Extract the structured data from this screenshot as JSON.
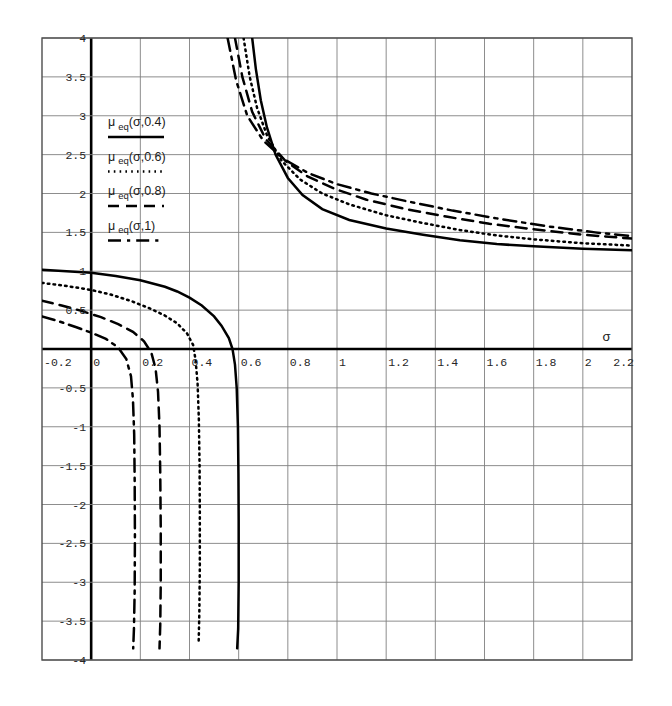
{
  "chart_data": {
    "type": "line",
    "title": "",
    "xlabel": "σ",
    "ylabel": "",
    "xlim": [
      -0.2,
      2.2
    ],
    "ylim": [
      -4,
      4
    ],
    "grid": true,
    "legend_position": "upper-left-inside",
    "x_ticks": [
      "-0.2",
      "0",
      "0.2",
      "0.4",
      "0.6",
      "0.8",
      "1",
      "1.2",
      "1.4",
      "1.6",
      "1.8",
      "2",
      "2.2"
    ],
    "x_tick_values": [
      -0.2,
      0,
      0.2,
      0.4,
      0.6,
      0.8,
      1,
      1.2,
      1.4,
      1.6,
      1.8,
      2,
      2.2
    ],
    "y_ticks": [
      "4",
      "3.5",
      "3",
      "2.5",
      "2",
      "1.5",
      "1",
      "0.5",
      "-0.5",
      "-1",
      "-1.5",
      "-2",
      "-2.5",
      "-3",
      "-3.5",
      "-4"
    ],
    "y_tick_values": [
      4,
      3.5,
      3,
      2.5,
      2,
      1.5,
      1,
      0.5,
      -0.5,
      -1,
      -1.5,
      -2,
      -2.5,
      -3,
      -3.5,
      -4
    ],
    "series": [
      {
        "name": "μ eq(σ,0.4)",
        "style": "solid",
        "color": "#000000",
        "asymptote": 0.6,
        "left_branch": [
          [
            -0.2,
            1.02
          ],
          [
            -0.1,
            1.0
          ],
          [
            0.0,
            0.98
          ],
          [
            0.1,
            0.94
          ],
          [
            0.2,
            0.885
          ],
          [
            0.3,
            0.8
          ],
          [
            0.35,
            0.74
          ],
          [
            0.4,
            0.66
          ],
          [
            0.45,
            0.56
          ],
          [
            0.5,
            0.42
          ],
          [
            0.53,
            0.3
          ],
          [
            0.56,
            0.14
          ],
          [
            0.575,
            0.0
          ],
          [
            0.585,
            -0.2
          ],
          [
            0.592,
            -0.5
          ],
          [
            0.597,
            -1.0
          ],
          [
            0.599,
            -1.6
          ],
          [
            0.6,
            -2.2
          ],
          [
            0.6,
            -3.0
          ],
          [
            0.598,
            -3.6
          ],
          [
            0.594,
            -3.85
          ]
        ],
        "right_branch": [
          [
            0.655,
            4.0
          ],
          [
            0.67,
            3.6
          ],
          [
            0.69,
            3.2
          ],
          [
            0.715,
            2.85
          ],
          [
            0.75,
            2.5
          ],
          [
            0.8,
            2.2
          ],
          [
            0.86,
            1.98
          ],
          [
            0.94,
            1.8
          ],
          [
            1.05,
            1.66
          ],
          [
            1.2,
            1.55
          ],
          [
            1.35,
            1.47
          ],
          [
            1.5,
            1.4
          ],
          [
            1.65,
            1.35
          ],
          [
            1.8,
            1.32
          ],
          [
            2.0,
            1.29
          ],
          [
            2.2,
            1.27
          ]
        ]
      },
      {
        "name": "μ eq(σ,0.6)",
        "style": "dotted",
        "color": "#000000",
        "asymptote": 0.44,
        "left_branch": [
          [
            -0.2,
            0.85
          ],
          [
            -0.1,
            0.81
          ],
          [
            0.0,
            0.76
          ],
          [
            0.08,
            0.7
          ],
          [
            0.16,
            0.62
          ],
          [
            0.24,
            0.52
          ],
          [
            0.3,
            0.43
          ],
          [
            0.35,
            0.33
          ],
          [
            0.39,
            0.2
          ],
          [
            0.415,
            0.05
          ],
          [
            0.425,
            -0.15
          ],
          [
            0.433,
            -0.45
          ],
          [
            0.438,
            -0.9
          ],
          [
            0.441,
            -1.5
          ],
          [
            0.442,
            -2.1
          ],
          [
            0.442,
            -2.8
          ],
          [
            0.44,
            -3.4
          ],
          [
            0.437,
            -3.8
          ]
        ],
        "right_branch": [
          [
            0.62,
            4.0
          ],
          [
            0.645,
            3.5
          ],
          [
            0.675,
            3.1
          ],
          [
            0.715,
            2.75
          ],
          [
            0.775,
            2.42
          ],
          [
            0.85,
            2.18
          ],
          [
            0.94,
            2.0
          ],
          [
            1.05,
            1.86
          ],
          [
            1.2,
            1.72
          ],
          [
            1.35,
            1.62
          ],
          [
            1.5,
            1.53
          ],
          [
            1.65,
            1.46
          ],
          [
            1.8,
            1.41
          ],
          [
            2.0,
            1.36
          ],
          [
            2.2,
            1.33
          ]
        ]
      },
      {
        "name": "μ eq(σ,0.8)",
        "style": "dashed",
        "color": "#000000",
        "asymptote": 0.28,
        "left_branch": [
          [
            -0.2,
            0.62
          ],
          [
            -0.12,
            0.56
          ],
          [
            -0.04,
            0.49
          ],
          [
            0.04,
            0.41
          ],
          [
            0.11,
            0.32
          ],
          [
            0.17,
            0.22
          ],
          [
            0.215,
            0.1
          ],
          [
            0.245,
            -0.05
          ],
          [
            0.262,
            -0.25
          ],
          [
            0.272,
            -0.55
          ],
          [
            0.278,
            -1.0
          ],
          [
            0.281,
            -1.6
          ],
          [
            0.283,
            -2.3
          ],
          [
            0.283,
            -3.0
          ],
          [
            0.281,
            -3.55
          ],
          [
            0.278,
            -3.85
          ]
        ],
        "right_branch": [
          [
            0.585,
            4.0
          ],
          [
            0.615,
            3.5
          ],
          [
            0.655,
            3.05
          ],
          [
            0.71,
            2.7
          ],
          [
            0.79,
            2.42
          ],
          [
            0.88,
            2.22
          ],
          [
            0.99,
            2.06
          ],
          [
            1.12,
            1.92
          ],
          [
            1.28,
            1.8
          ],
          [
            1.45,
            1.7
          ],
          [
            1.62,
            1.61
          ],
          [
            1.8,
            1.54
          ],
          [
            2.0,
            1.47
          ],
          [
            2.2,
            1.42
          ]
        ]
      },
      {
        "name": "μ eq(σ,1)",
        "style": "dashdot",
        "color": "#000000",
        "asymptote": 0.175,
        "left_branch": [
          [
            -0.2,
            0.42
          ],
          [
            -0.13,
            0.355
          ],
          [
            -0.06,
            0.28
          ],
          [
            0.0,
            0.21
          ],
          [
            0.06,
            0.13
          ],
          [
            0.11,
            0.02
          ],
          [
            0.143,
            -0.13
          ],
          [
            0.162,
            -0.35
          ],
          [
            0.17,
            -0.65
          ],
          [
            0.175,
            -1.1
          ],
          [
            0.177,
            -1.7
          ],
          [
            0.178,
            -2.4
          ],
          [
            0.177,
            -3.1
          ],
          [
            0.174,
            -3.6
          ],
          [
            0.171,
            -3.85
          ]
        ],
        "right_branch": [
          [
            0.555,
            4.0
          ],
          [
            0.59,
            3.45
          ],
          [
            0.635,
            3.0
          ],
          [
            0.7,
            2.68
          ],
          [
            0.785,
            2.44
          ],
          [
            0.885,
            2.26
          ],
          [
            1.0,
            2.12
          ],
          [
            1.14,
            2.0
          ],
          [
            1.3,
            1.89
          ],
          [
            1.47,
            1.78
          ],
          [
            1.65,
            1.68
          ],
          [
            1.85,
            1.58
          ],
          [
            2.05,
            1.5
          ],
          [
            2.2,
            1.45
          ]
        ]
      }
    ]
  },
  "legend": {
    "items": [
      {
        "base": "μ",
        "sub": "eq",
        "arg": "(σ,0.4)",
        "style": "solid"
      },
      {
        "base": "μ",
        "sub": "eq",
        "arg": "(σ,0.6)",
        "style": "dotted"
      },
      {
        "base": "μ",
        "sub": "eq",
        "arg": "(σ,0.8)",
        "style": "dashed"
      },
      {
        "base": "μ",
        "sub": "eq",
        "arg": "(σ,1)",
        "style": "dashdot"
      }
    ]
  },
  "colors": {
    "curve": "#000000",
    "grid": "#808080",
    "axis": "#000000",
    "frame": "#4d4d4d",
    "background": "#ffffff"
  }
}
